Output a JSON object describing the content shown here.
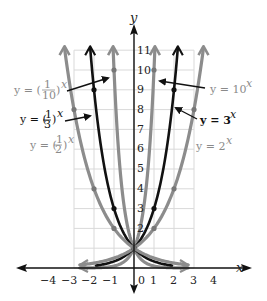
{
  "chart_data": {
    "type": "line",
    "title": "",
    "xlabel": "x",
    "ylabel": "y",
    "xlim": [
      -4,
      4
    ],
    "ylim": [
      0,
      11
    ],
    "grid": true,
    "grid_x_range": [
      -3,
      3
    ],
    "grid_y_range": [
      0,
      11
    ],
    "x_ticks": [
      "-4",
      "-3",
      "-2",
      "-1",
      "0",
      "1",
      "2",
      "3",
      "4"
    ],
    "y_ticks": [
      "2",
      "3",
      "4",
      "5",
      "6",
      "7",
      "8",
      "9",
      "10",
      "11"
    ],
    "series": [
      {
        "name": "y = 10^x",
        "base": 10,
        "color": "#8c8c8c",
        "width": 3.2,
        "points": [
          {
            "x": 0,
            "y": 1
          },
          {
            "x": 1,
            "y": 10
          }
        ]
      },
      {
        "name": "y = 3^x",
        "base": 3,
        "color": "#111111",
        "width": 2.6,
        "points": [
          {
            "x": 0,
            "y": 1
          },
          {
            "x": 1,
            "y": 3
          },
          {
            "x": 2,
            "y": 9
          }
        ]
      },
      {
        "name": "y = 2^x",
        "base": 2,
        "color": "#8c8c8c",
        "width": 3.2,
        "points": [
          {
            "x": 0,
            "y": 1
          },
          {
            "x": 1,
            "y": 2
          },
          {
            "x": 2,
            "y": 4
          },
          {
            "x": 3,
            "y": 8
          }
        ]
      },
      {
        "name": "y = (1/10)^x",
        "base": 0.1,
        "color": "#8c8c8c",
        "width": 3.2,
        "points": [
          {
            "x": 0,
            "y": 1
          },
          {
            "x": -1,
            "y": 10
          }
        ]
      },
      {
        "name": "y = (1/3)^x",
        "base": 0.3333,
        "color": "#111111",
        "width": 2.6,
        "points": [
          {
            "x": 0,
            "y": 1
          },
          {
            "x": -1,
            "y": 3
          },
          {
            "x": -2,
            "y": 9
          }
        ]
      },
      {
        "name": "y = (1/2)^x",
        "base": 0.5,
        "color": "#8c8c8c",
        "width": 3.2,
        "points": [
          {
            "x": 0,
            "y": 1
          },
          {
            "x": -1,
            "y": 2
          },
          {
            "x": -2,
            "y": 4
          },
          {
            "x": -3,
            "y": 8
          }
        ]
      }
    ],
    "annotations": [
      {
        "text": "y = (1/10)^x",
        "side": "left",
        "arrow": true
      },
      {
        "text": "y = (1/3)^x",
        "side": "left",
        "arrow": true
      },
      {
        "text": "y = (1/2)^x",
        "side": "left",
        "arrow": false
      },
      {
        "text": "y = 10^x",
        "side": "right",
        "arrow": true
      },
      {
        "text": "y = 3^x",
        "side": "right",
        "arrow": true
      },
      {
        "text": "y = 2^x",
        "side": "right",
        "arrow": false
      }
    ]
  },
  "labels": {
    "x_axis": "x",
    "y_axis": "y",
    "eq_tenth_prefix": "y = (",
    "eq_tenth_num": "1",
    "eq_tenth_den": "10",
    "eq_tenth_exp": "x",
    "eq_third_prefix": "y = (",
    "eq_third_num": "1",
    "eq_third_den": "3",
    "eq_third_exp": "x",
    "eq_half_prefix": "y = (",
    "eq_half_num": "1",
    "eq_half_den": "2",
    "eq_half_exp": "x",
    "eq_ten": "y = 10",
    "eq_ten_exp": "x",
    "eq_three": "y = 3",
    "eq_three_exp": "x",
    "eq_two": "y = 2",
    "eq_two_exp": "x",
    "paren_close": ")",
    "x_ticks": [
      "−4",
      "−3",
      "−2",
      "−1",
      "0",
      "1",
      "2",
      "3",
      "4"
    ],
    "y_ticks": [
      "2",
      "3",
      "4",
      "5",
      "6",
      "7",
      "8",
      "9",
      "10",
      "11"
    ]
  }
}
